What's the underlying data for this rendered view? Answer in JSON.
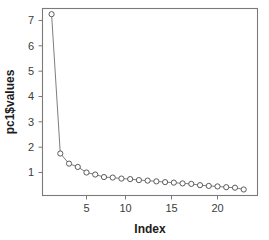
{
  "chart_data": {
    "type": "line",
    "title": "",
    "subtitle": "",
    "xlabel": "Index",
    "ylabel": "pc1$values",
    "xlim": [
      1,
      23
    ],
    "ylim": [
      0.28,
      7.25
    ],
    "grid": false,
    "legend": null,
    "marker": "open-circle",
    "x": [
      1,
      2,
      3,
      4,
      5,
      6,
      7,
      8,
      9,
      10,
      11,
      12,
      13,
      14,
      15,
      16,
      17,
      18,
      19,
      20,
      21,
      22,
      23
    ],
    "values": [
      7.25,
      1.75,
      1.35,
      1.22,
      1.0,
      0.92,
      0.82,
      0.8,
      0.76,
      0.74,
      0.7,
      0.68,
      0.65,
      0.62,
      0.6,
      0.57,
      0.55,
      0.5,
      0.47,
      0.45,
      0.42,
      0.4,
      0.33
    ],
    "series": [
      {
        "name": "pc1$values",
        "values": [
          7.25,
          1.75,
          1.35,
          1.22,
          1.0,
          0.92,
          0.82,
          0.8,
          0.76,
          0.74,
          0.7,
          0.68,
          0.65,
          0.62,
          0.6,
          0.57,
          0.55,
          0.5,
          0.47,
          0.45,
          0.42,
          0.4,
          0.33
        ]
      }
    ],
    "xticks": [
      5,
      10,
      15,
      20
    ],
    "xtick_labels": [
      "5",
      "10",
      "15",
      "20"
    ],
    "yticks": [
      1,
      2,
      3,
      4,
      5,
      6,
      7
    ],
    "ytick_labels": [
      "1",
      "2",
      "3",
      "4",
      "5",
      "6",
      "7"
    ]
  },
  "axes": {
    "x_title": "Index",
    "y_title": "pc1$values"
  },
  "colors": {
    "background": "#ffffff",
    "frame": "#7a7a7a",
    "line": "#6e6e6e",
    "marker_stroke": "#4a4a4a",
    "marker_fill": "#ffffff",
    "tick_label": "#3c3c3c",
    "axis_title": "#1c1c1c"
  }
}
